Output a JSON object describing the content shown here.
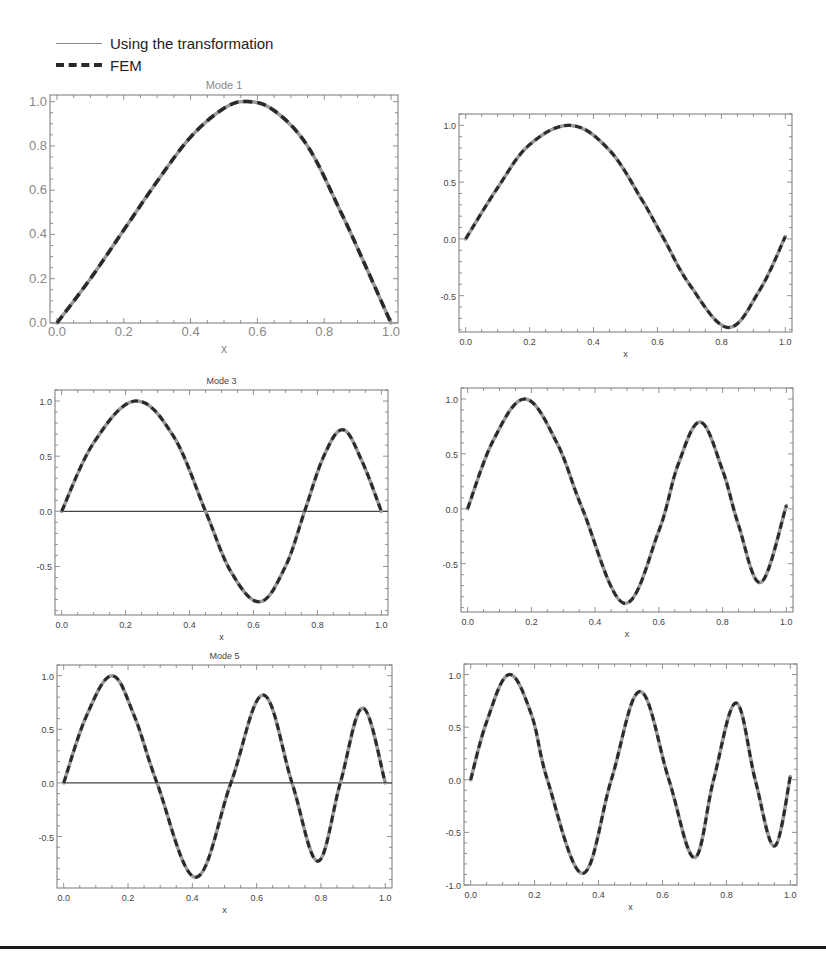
{
  "legend": {
    "items": [
      {
        "label": "Using the transformation",
        "style": "solid",
        "color": "#8a8a8a"
      },
      {
        "label": "FEM",
        "style": "dashed",
        "color": "#2a2a2a"
      }
    ]
  },
  "chart_data": [
    {
      "type": "line",
      "title": "Mode 1",
      "xlabel": "x",
      "ylabel": "",
      "xlim": [
        0,
        1
      ],
      "ylim": [
        0,
        1.03
      ],
      "xticks": [
        "0.0",
        "0.2",
        "0.4",
        "0.6",
        "0.8",
        "1.0"
      ],
      "yticks": [
        "0.0",
        "0.2",
        "0.4",
        "0.6",
        "0.8",
        "1.0"
      ],
      "zero_line": false,
      "frame": {
        "left": 50,
        "top": 95,
        "right": 398,
        "bottom": 323
      },
      "series": [
        {
          "name": "Using the transformation",
          "x": [
            0,
            0.1,
            0.2,
            0.3,
            0.4,
            0.5,
            0.57,
            0.65,
            0.75,
            0.85,
            0.92,
            1.0
          ],
          "values": [
            0,
            0.2,
            0.42,
            0.64,
            0.84,
            0.97,
            1.0,
            0.96,
            0.8,
            0.5,
            0.27,
            0
          ]
        },
        {
          "name": "FEM",
          "x": [
            0,
            0.1,
            0.2,
            0.3,
            0.4,
            0.5,
            0.57,
            0.65,
            0.75,
            0.85,
            0.92,
            1.0
          ],
          "values": [
            0,
            0.2,
            0.42,
            0.64,
            0.84,
            0.97,
            1.0,
            0.96,
            0.8,
            0.5,
            0.27,
            0
          ]
        }
      ]
    },
    {
      "type": "line",
      "title": "",
      "xlabel": "x",
      "ylabel": "",
      "xlim": [
        0,
        1
      ],
      "ylim": [
        -0.82,
        1.1
      ],
      "xticks": [
        "0.0",
        "0.2",
        "0.4",
        "0.6",
        "0.8",
        "1.0"
      ],
      "yticks": [
        "-0.5",
        "0.0",
        "0.5",
        "1.0"
      ],
      "zero_line": false,
      "frame": {
        "left": 459,
        "top": 114,
        "right": 792,
        "bottom": 332
      },
      "series": [
        {
          "name": "Using the transformation",
          "x": [
            0,
            0.1,
            0.2,
            0.33,
            0.45,
            0.55,
            0.62,
            0.7,
            0.82,
            0.92,
            1.0
          ],
          "values": [
            0,
            0.45,
            0.83,
            1.0,
            0.78,
            0.35,
            0.0,
            -0.4,
            -0.78,
            -0.45,
            0.02
          ]
        },
        {
          "name": "FEM",
          "x": [
            0,
            0.1,
            0.2,
            0.33,
            0.45,
            0.55,
            0.62,
            0.7,
            0.82,
            0.92,
            1.0
          ],
          "values": [
            0,
            0.45,
            0.83,
            1.0,
            0.78,
            0.35,
            0.0,
            -0.4,
            -0.78,
            -0.45,
            0.02
          ]
        }
      ]
    },
    {
      "type": "line",
      "title": "Mode 3",
      "xlabel": "x",
      "ylabel": "",
      "xlim": [
        0,
        1
      ],
      "ylim": [
        -0.94,
        1.1
      ],
      "xticks": [
        "0.0",
        "0.2",
        "0.4",
        "0.6",
        "0.8",
        "1.0"
      ],
      "yticks": [
        "-0.5",
        "0.0",
        "0.5",
        "1.0"
      ],
      "zero_line": true,
      "frame": {
        "left": 55,
        "top": 390,
        "right": 388,
        "bottom": 615
      },
      "series": [
        {
          "name": "Using the transformation",
          "x": [
            0,
            0.1,
            0.23,
            0.35,
            0.45,
            0.53,
            0.62,
            0.7,
            0.76,
            0.82,
            0.88,
            0.94,
            1.0
          ],
          "values": [
            0,
            0.62,
            1.0,
            0.68,
            0.0,
            -0.55,
            -0.82,
            -0.5,
            0.0,
            0.5,
            0.74,
            0.45,
            0.0
          ]
        },
        {
          "name": "FEM",
          "x": [
            0,
            0.1,
            0.23,
            0.35,
            0.45,
            0.53,
            0.62,
            0.7,
            0.76,
            0.82,
            0.88,
            0.94,
            1.0
          ],
          "values": [
            0,
            0.62,
            1.0,
            0.68,
            0.0,
            -0.55,
            -0.82,
            -0.5,
            0.0,
            0.5,
            0.74,
            0.45,
            0.0
          ]
        }
      ]
    },
    {
      "type": "line",
      "title": "",
      "xlabel": "x",
      "ylabel": "",
      "xlim": [
        0,
        1
      ],
      "ylim": [
        -0.94,
        1.1
      ],
      "xticks": [
        "0.0",
        "0.2",
        "0.4",
        "0.6",
        "0.8",
        "1.0"
      ],
      "yticks": [
        "-0.5",
        "0.0",
        "0.5",
        "1.0"
      ],
      "zero_line": false,
      "frame": {
        "left": 461,
        "top": 388,
        "right": 793,
        "bottom": 612
      },
      "series": [
        {
          "name": "Using the transformation",
          "x": [
            0,
            0.08,
            0.18,
            0.28,
            0.36,
            0.49,
            0.6,
            0.66,
            0.73,
            0.8,
            0.85,
            0.92,
            1.0
          ],
          "values": [
            0,
            0.62,
            1.0,
            0.6,
            0.0,
            -0.86,
            -0.2,
            0.4,
            0.79,
            0.35,
            -0.15,
            -0.67,
            0.03
          ]
        },
        {
          "name": "FEM",
          "x": [
            0,
            0.08,
            0.18,
            0.28,
            0.36,
            0.49,
            0.6,
            0.66,
            0.73,
            0.8,
            0.85,
            0.92,
            1.0
          ],
          "values": [
            0,
            0.62,
            1.0,
            0.6,
            0.0,
            -0.86,
            -0.2,
            0.4,
            0.79,
            0.35,
            -0.15,
            -0.67,
            0.03
          ]
        }
      ]
    },
    {
      "type": "line",
      "title": "Mode 5",
      "xlabel": "x",
      "ylabel": "",
      "xlim": [
        0,
        1
      ],
      "ylim": [
        -0.98,
        1.1
      ],
      "xticks": [
        "0.0",
        "0.2",
        "0.4",
        "0.6",
        "0.8",
        "1.0"
      ],
      "yticks": [
        "-0.5",
        "0.0",
        "0.5",
        "1.0"
      ],
      "zero_line": true,
      "frame": {
        "left": 57,
        "top": 665,
        "right": 392,
        "bottom": 888
      },
      "series": [
        {
          "name": "Using the transformation",
          "x": [
            0,
            0.07,
            0.15,
            0.22,
            0.29,
            0.41,
            0.52,
            0.62,
            0.71,
            0.79,
            0.86,
            0.93,
            1.0
          ],
          "values": [
            0,
            0.62,
            1.0,
            0.62,
            0.0,
            -0.88,
            0.0,
            0.82,
            0.0,
            -0.73,
            0.0,
            0.7,
            0.0
          ]
        },
        {
          "name": "FEM",
          "x": [
            0,
            0.07,
            0.15,
            0.22,
            0.29,
            0.41,
            0.52,
            0.62,
            0.71,
            0.79,
            0.86,
            0.93,
            1.0
          ],
          "values": [
            0,
            0.62,
            1.0,
            0.62,
            0.0,
            -0.88,
            0.0,
            0.82,
            0.0,
            -0.73,
            0.0,
            0.7,
            0.0
          ]
        }
      ]
    },
    {
      "type": "line",
      "title": "",
      "xlabel": "x",
      "ylabel": "",
      "xlim": [
        0,
        1
      ],
      "ylim": [
        -1.0,
        1.1
      ],
      "xticks": [
        "0.0",
        "0.2",
        "0.4",
        "0.6",
        "0.8",
        "1.0"
      ],
      "yticks": [
        "-1.0",
        "-0.5",
        "0.0",
        "0.5",
        "1.0"
      ],
      "zero_line": false,
      "frame": {
        "left": 464,
        "top": 664,
        "right": 797,
        "bottom": 885
      },
      "series": [
        {
          "name": "Using the transformation",
          "x": [
            0,
            0.05,
            0.12,
            0.19,
            0.24,
            0.35,
            0.44,
            0.53,
            0.62,
            0.7,
            0.76,
            0.83,
            0.89,
            0.95,
            1.0
          ],
          "values": [
            0,
            0.55,
            1.0,
            0.62,
            0.0,
            -0.89,
            0.0,
            0.84,
            0.0,
            -0.74,
            0.0,
            0.73,
            0.0,
            -0.63,
            0.03
          ]
        },
        {
          "name": "FEM",
          "x": [
            0,
            0.05,
            0.12,
            0.19,
            0.24,
            0.35,
            0.44,
            0.53,
            0.62,
            0.7,
            0.76,
            0.83,
            0.89,
            0.95,
            1.0
          ],
          "values": [
            0,
            0.55,
            1.0,
            0.62,
            0.0,
            -0.89,
            0.0,
            0.84,
            0.0,
            -0.74,
            0.0,
            0.73,
            0.0,
            -0.63,
            0.03
          ]
        }
      ]
    }
  ]
}
